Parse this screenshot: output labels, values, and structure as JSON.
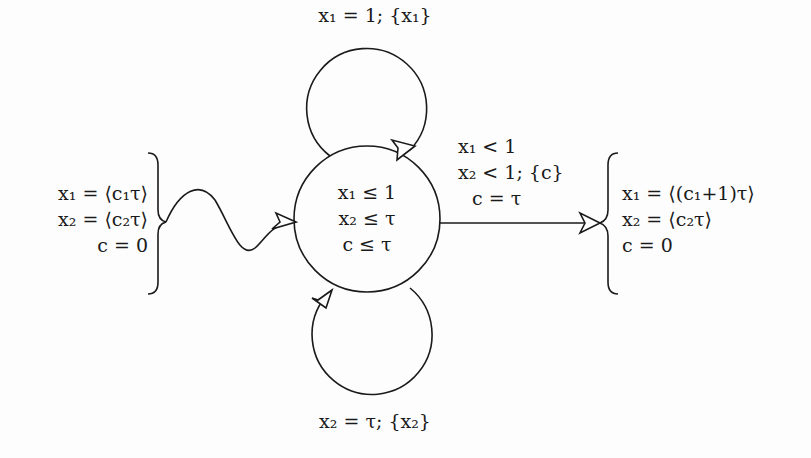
{
  "diagram": {
    "type": "timed-automaton-state",
    "state": {
      "invariants": [
        "x₁ ≤ 1",
        "x₂ ≤ τ",
        "c ≤ τ"
      ]
    },
    "loops": {
      "top": {
        "label": "x₁ = 1; {x₁}"
      },
      "bottom": {
        "label": "x₂ = τ; {x₂}"
      }
    },
    "entry": {
      "conditions": [
        "x₁ = ⟨c₁τ⟩",
        "x₂ = ⟨c₂τ⟩",
        "c = 0"
      ]
    },
    "exit": {
      "guard": [
        "x₁ < 1",
        "x₂ < 1; {c}",
        "c = τ"
      ],
      "conditions": [
        "x₁ = ⟨(c₁+1)τ⟩",
        "x₂ = ⟨c₂τ⟩",
        "c = 0"
      ]
    },
    "colors": {
      "stroke": "#1a1a1a",
      "background": "#fdfdfd",
      "arrowhead_fill": "#ffffff"
    }
  }
}
